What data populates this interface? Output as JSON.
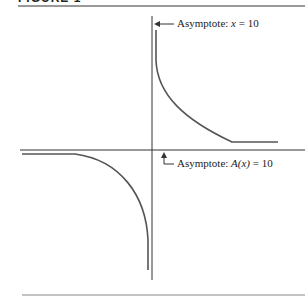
{
  "figure": {
    "label": "FIGURE 1"
  },
  "annotations": {
    "vertical_asymptote": "Asymptote: x = 10",
    "vertical_prefix": "Asymptote: ",
    "vertical_var": "x",
    "vertical_eq": " = 10",
    "horizontal_asymptote": "Asymptote: A(x) = 10",
    "horizontal_prefix": "Asymptote: ",
    "horizontal_var": "A(x)",
    "horizontal_eq": " = 10"
  },
  "colors": {
    "axis": "#333333",
    "curve": "#555555",
    "rule": "#777777"
  }
}
